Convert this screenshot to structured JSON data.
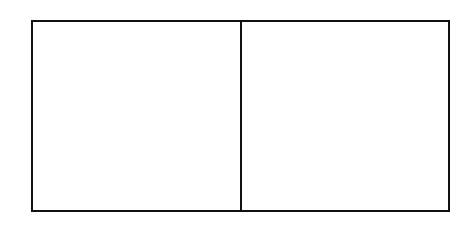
{
  "diagram": {
    "stroke_color": "#111111",
    "background": "#ffffff",
    "panels": [
      {
        "name": "left-panel",
        "x": 31,
        "y": 20,
        "width": 211,
        "height": 192
      },
      {
        "name": "right-panel",
        "x": 240,
        "y": 20,
        "width": 210,
        "height": 192
      }
    ]
  }
}
